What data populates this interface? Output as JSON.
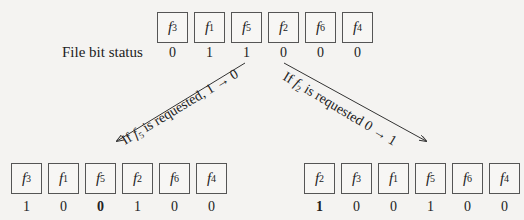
{
  "label": "File bit status",
  "top_row": {
    "files": [
      "3",
      "1",
      "5",
      "2",
      "6",
      "4"
    ],
    "bits": [
      "0",
      "1",
      "1",
      "0",
      "0",
      "0"
    ],
    "bold": [
      false,
      false,
      false,
      false,
      false,
      false
    ]
  },
  "left_row": {
    "files": [
      "3",
      "1",
      "5",
      "2",
      "6",
      "4"
    ],
    "bits": [
      "1",
      "0",
      "0",
      "1",
      "0",
      "0"
    ],
    "bold": [
      false,
      false,
      true,
      false,
      false,
      false
    ]
  },
  "right_row": {
    "files": [
      "2",
      "3",
      "1",
      "5",
      "6",
      "4"
    ],
    "bits": [
      "1",
      "0",
      "0",
      "1",
      "0",
      "0"
    ],
    "bold": [
      true,
      false,
      false,
      false,
      false,
      false
    ]
  },
  "arrows": {
    "left_text": "If f5 is requested, 1 → 0",
    "right_text": "If f2 is requested 0 → 1"
  }
}
